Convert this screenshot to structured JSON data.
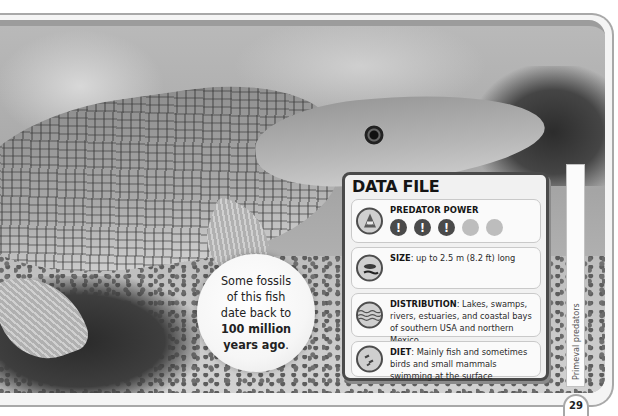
{
  "fact_bubble": {
    "lines": [
      "Some fossils",
      "of this fish",
      "date back to"
    ],
    "bold_lines": [
      "100 million",
      "years ago"
    ],
    "trailing": "."
  },
  "data_file": {
    "title": "DATA FILE",
    "predator_power": {
      "label": "PREDATOR POWER",
      "icon": "shark-jaws-icon",
      "rating": 3,
      "max": 5,
      "dots": [
        "!",
        "!",
        "!",
        "",
        ""
      ]
    },
    "size": {
      "icon": "fish-and-diver-icon",
      "label": "SIZE",
      "text": ": up to 2.5 m (8.2 ft) long"
    },
    "distribution": {
      "icon": "water-waves-icon",
      "label": "DISTRIBUTION",
      "text": ": Lakes, swamps, rivers, estuaries, and coastal bays of southern USA and northern Mexico"
    },
    "diet": {
      "icon": "small-fish-icon",
      "label": "DIET",
      "text": ": Mainly fish and sometimes birds and small mammals swimming at the surface"
    }
  },
  "section_tab": "Primeval predators",
  "page_number": "29",
  "colors": {
    "panel_border": "#4a4a4a",
    "rating_on": "#4a4a4a",
    "rating_off": "#bdbdbd"
  }
}
